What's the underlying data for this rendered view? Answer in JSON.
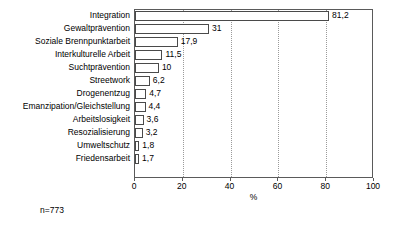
{
  "chart_data": {
    "type": "bar",
    "orientation": "horizontal",
    "title": "",
    "xlabel": "%",
    "ylabel": "",
    "xlim": [
      0,
      100
    ],
    "xticks": [
      0,
      20,
      40,
      60,
      80,
      100
    ],
    "xtick_labels": [
      "0",
      "20",
      "40",
      "60",
      "80",
      "100"
    ],
    "grid": "vertical-dotted",
    "legend": "none",
    "decimal_separator": ",",
    "categories": [
      "Integration",
      "Gewaltprävention",
      "Soziale Brennpunktarbeit",
      "Interkulturelle Arbeit",
      "Suchtprävention",
      "Streetwork",
      "Drogenentzug",
      "Emanzipation/Gleichstellung",
      "Arbeitslosigkeit",
      "Resozialisierung",
      "Umweltschutz",
      "Friedensarbeit"
    ],
    "values": [
      81.2,
      31,
      17.9,
      11.5,
      10,
      6.2,
      4.7,
      4.4,
      3.6,
      3.2,
      1.8,
      1.7
    ],
    "value_labels": [
      "81,2",
      "31",
      "17,9",
      "11,5",
      "10",
      "6,2",
      "4,7",
      "4,4",
      "3,6",
      "3,2",
      "1,8",
      "1,7"
    ],
    "annotation": "n=773",
    "colors": {
      "bar_fill": "#ffffff",
      "bar_border": "#4a4a4a",
      "frame": "#5a5a5a",
      "gridline": "#9a9a9a",
      "text": "#000000",
      "background": "#ffffff"
    }
  }
}
